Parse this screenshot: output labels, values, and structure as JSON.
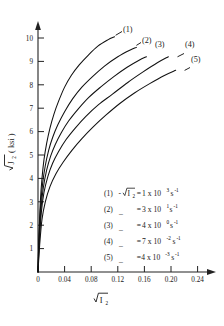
{
  "chart_data": {
    "type": "line",
    "title": "",
    "xlabel": "√I₂",
    "ylabel": "√J₂ (ksi)",
    "xlim": [
      0,
      0.26
    ],
    "ylim": [
      0,
      10.4
    ],
    "grid": false,
    "legend_position": "inside-lower-right",
    "xticks": [
      "0",
      "0.04",
      "0.08",
      "0.12",
      "0.16",
      "0.20",
      "0.24"
    ],
    "xtick_values": [
      0,
      0.04,
      0.08,
      0.12,
      0.16,
      0.2,
      0.24
    ],
    "yticks": [
      "1",
      "2",
      "3",
      "4",
      "5",
      "6",
      "7",
      "8",
      "9",
      "10"
    ],
    "ytick_values": [
      1,
      2,
      3,
      4,
      5,
      6,
      7,
      8,
      9,
      10
    ],
    "series": [
      {
        "name": "(1)",
        "label": "(1)",
        "strain_rate": "1 x 10³ s⁻¹",
        "x": [
          0.0,
          0.0015,
          0.0035,
          0.006,
          0.009,
          0.013,
          0.018,
          0.024,
          0.031,
          0.04,
          0.05,
          0.062,
          0.075,
          0.09,
          0.105,
          0.115
        ],
        "y": [
          0.0,
          1.6,
          3.0,
          4.0,
          4.8,
          5.5,
          6.15,
          6.75,
          7.3,
          7.9,
          8.4,
          8.85,
          9.25,
          9.65,
          9.92,
          10.05
        ]
      },
      {
        "name": "(2)",
        "label": "(2)",
        "strain_rate": "3 x 10¹ s⁻¹",
        "x": [
          0.0,
          0.0015,
          0.004,
          0.007,
          0.011,
          0.016,
          0.022,
          0.03,
          0.04,
          0.052,
          0.066,
          0.082,
          0.1,
          0.12,
          0.138,
          0.148
        ],
        "y": [
          0.0,
          1.5,
          2.85,
          3.8,
          4.55,
          5.2,
          5.75,
          6.3,
          6.85,
          7.4,
          7.9,
          8.35,
          8.8,
          9.2,
          9.48,
          9.6
        ]
      },
      {
        "name": "(3)",
        "label": "(3)",
        "strain_rate": "4 x 10⁰ s⁻¹",
        "x": [
          0.0,
          0.0018,
          0.0045,
          0.008,
          0.013,
          0.019,
          0.026,
          0.035,
          0.046,
          0.06,
          0.076,
          0.094,
          0.114,
          0.134,
          0.152,
          0.163
        ],
        "y": [
          0.0,
          1.4,
          2.7,
          3.6,
          4.35,
          4.95,
          5.45,
          5.95,
          6.45,
          6.95,
          7.45,
          7.9,
          8.35,
          8.75,
          9.05,
          9.2
        ]
      },
      {
        "name": "(4)",
        "label": "(4)",
        "strain_rate": "7 x 10⁻² s⁻¹",
        "x": [
          0.0,
          0.002,
          0.005,
          0.009,
          0.015,
          0.022,
          0.031,
          0.042,
          0.056,
          0.072,
          0.091,
          0.112,
          0.135,
          0.158,
          0.18,
          0.196
        ],
        "y": [
          0.0,
          1.3,
          2.55,
          3.4,
          4.1,
          4.65,
          5.15,
          5.65,
          6.15,
          6.65,
          7.15,
          7.6,
          8.1,
          8.55,
          8.95,
          9.2
        ]
      },
      {
        "name": "(5)",
        "label": "(5)",
        "strain_rate": "4 x 10⁻³ s⁻¹",
        "x": [
          0.0,
          0.0025,
          0.006,
          0.011,
          0.018,
          0.027,
          0.038,
          0.051,
          0.066,
          0.083,
          0.102,
          0.123,
          0.145,
          0.168,
          0.19,
          0.207
        ],
        "y": [
          0.0,
          1.15,
          2.25,
          3.0,
          3.65,
          4.2,
          4.7,
          5.2,
          5.7,
          6.2,
          6.7,
          7.2,
          7.65,
          8.05,
          8.4,
          8.62
        ]
      }
    ],
    "annotations": [
      {
        "text": "(1)",
        "x": 0.118,
        "y": 10.15
      },
      {
        "text": "(2)",
        "x": 0.149,
        "y": 9.72
      },
      {
        "text": "(3)",
        "x": 0.168,
        "y": 9.5
      },
      {
        "text": "(4)",
        "x": 0.206,
        "y": 9.5
      },
      {
        "text": "(5)",
        "x": 0.212,
        "y": 8.85
      }
    ]
  },
  "legend": {
    "rows": [
      {
        "key": "(1)",
        "prefix": "(1)",
        "symbol": "-√I₂",
        "equals": "=",
        "mantissa": "1 x 10",
        "exponent": "3",
        "unit": "s",
        "unit_exponent": "-1"
      },
      {
        "key": "(2)",
        "prefix": "(2)",
        "symbol": "_",
        "equals": "=",
        "mantissa": "3 x 10",
        "exponent": "1",
        "unit": "s",
        "unit_exponent": "-1"
      },
      {
        "key": "(3)",
        "prefix": "(3)",
        "symbol": "_",
        "equals": "=",
        "mantissa": "4 x 10",
        "exponent": "0",
        "unit": "s",
        "unit_exponent": "-1"
      },
      {
        "key": "(4)",
        "prefix": "(4)",
        "symbol": "_",
        "equals": "=",
        "mantissa": "7 x 10",
        "exponent": "-2",
        "unit": "s",
        "unit_exponent": "-1"
      },
      {
        "key": "(5)",
        "prefix": "(5)",
        "symbol": "_",
        "equals": "=",
        "mantissa": "4 x 10",
        "exponent": "-3",
        "unit": "s",
        "unit_exponent": "-1"
      }
    ]
  },
  "axes": {
    "y_label_root": "J",
    "y_label_sub": "2",
    "y_label_unit": "( ksi )",
    "x_label_root": "I",
    "x_label_sub": "2",
    "origin_label": "0"
  },
  "colors": {
    "ink": "#111111",
    "background": "#ffffff"
  }
}
